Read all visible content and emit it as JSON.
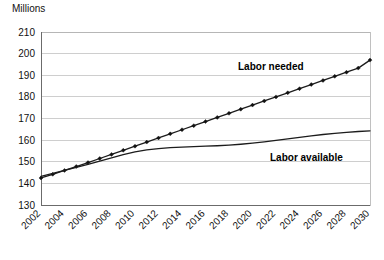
{
  "chart_data": {
    "type": "line",
    "title": "",
    "subtitle": "",
    "xlabel": "",
    "ylabel": "Millions",
    "ylim": [
      130,
      210
    ],
    "ytick_step": 10,
    "yticks": [
      130,
      140,
      150,
      160,
      170,
      180,
      190,
      200,
      210
    ],
    "grid": true,
    "legend_position": "inline-annotations",
    "x": [
      2002,
      2003,
      2004,
      2005,
      2006,
      2007,
      2008,
      2009,
      2010,
      2011,
      2012,
      2013,
      2014,
      2015,
      2016,
      2017,
      2018,
      2019,
      2020,
      2021,
      2022,
      2023,
      2024,
      2025,
      2026,
      2027,
      2028,
      2029,
      2030
    ],
    "xtick_labels": [
      "2002",
      "2004",
      "2006",
      "2008",
      "2010",
      "2012",
      "2014",
      "2016",
      "2018",
      "2020",
      "2022",
      "2024",
      "2026",
      "2028",
      "2030"
    ],
    "xtick_values": [
      2002,
      2004,
      2006,
      2008,
      2010,
      2012,
      2014,
      2016,
      2018,
      2020,
      2022,
      2024,
      2026,
      2028,
      2030
    ],
    "series": [
      {
        "name": "Labor needed",
        "label": "Labor needed",
        "color": "#1c1c1c",
        "markers": true,
        "values": [
          142.5,
          144.2,
          146.0,
          147.8,
          149.6,
          151.5,
          153.4,
          155.3,
          157.2,
          159.1,
          161.0,
          162.9,
          164.8,
          166.7,
          168.6,
          170.5,
          172.4,
          174.3,
          176.2,
          178.1,
          180.0,
          181.9,
          183.8,
          185.7,
          187.6,
          189.5,
          191.4,
          193.3,
          197.0
        ]
      },
      {
        "name": "Labor available",
        "label": "Labor available",
        "color": "#1c1c1c",
        "markers": false,
        "values": [
          143.2,
          144.6,
          146.0,
          147.4,
          148.8,
          150.3,
          151.8,
          153.3,
          154.6,
          155.5,
          156.1,
          156.5,
          156.8,
          157.0,
          157.2,
          157.4,
          157.7,
          158.1,
          158.6,
          159.2,
          159.9,
          160.6,
          161.3,
          162.0,
          162.6,
          163.1,
          163.6,
          164.0,
          164.3
        ]
      }
    ],
    "annotations": [
      {
        "text": "Labor needed",
        "x": 2019,
        "y": 192
      },
      {
        "text": "Labor available",
        "x": 2027,
        "y": 152
      }
    ]
  },
  "plot": {
    "left": 41,
    "top": 32,
    "right": 370,
    "bottom": 205
  },
  "label_positions": {
    "labor_needed": {
      "x": 238,
      "y": 70
    },
    "labor_available": {
      "x": 270,
      "y": 161
    }
  }
}
